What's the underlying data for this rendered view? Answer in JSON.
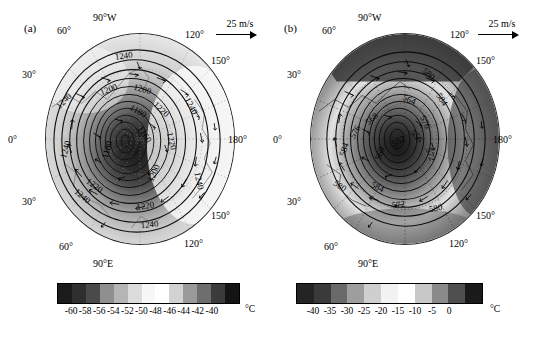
{
  "figure": {
    "type": "two-panel polar stereographic map figure",
    "background": "#ffffff",
    "width": 537,
    "height": 337
  },
  "panels": [
    {
      "id": "a",
      "label": "(a)",
      "projection": "south polar stereographic",
      "wind_scale": {
        "label": "25 m/s",
        "arrow": "right-arrow"
      },
      "lon_labels": {
        "top": "90°W",
        "top_left": "60°",
        "top_right": "120°",
        "left_upper": "30°",
        "left_middle": "0°",
        "left_lower": "30°",
        "right_upper": "150°",
        "right_middle": "180°",
        "right_lower": "150°",
        "bottom": "90°E",
        "bottom_left": "60°",
        "bottom_right": "120°"
      },
      "contour_labels": [
        "1240",
        "1240",
        "1240",
        "1240",
        "1240",
        "1240",
        "1240",
        "1220",
        "1220",
        "1220",
        "1220",
        "1200",
        "1200",
        "1200",
        "1180",
        "1180",
        "1160"
      ],
      "colorbar": {
        "unit": "°C",
        "ticks": [
          "-60",
          "-58",
          "-56",
          "-54",
          "-52",
          "-50",
          "-48",
          "-46",
          "-44",
          "-42",
          "-40"
        ],
        "min": -60,
        "max": -40,
        "step": 2,
        "colors": [
          "#1b1b1b",
          "#2f2f2f",
          "#4a4a4a",
          "#8f8f8f",
          "#b5b5b5",
          "#dcdcdc",
          "#f7f7f7",
          "#ffffff",
          "#d2d2d2",
          "#9a9a9a",
          "#6e6e6e",
          "#3b3b3b",
          "#141414"
        ]
      }
    },
    {
      "id": "b",
      "label": "(b)",
      "projection": "south polar stereographic",
      "wind_scale": {
        "label": "25 m/s",
        "arrow": "right-arrow"
      },
      "lon_labels": {
        "top": "90°W",
        "top_left": "60°",
        "top_right": "120°",
        "left_upper": "30°",
        "left_middle": "0°",
        "left_lower": "30°",
        "right_upper": "150°",
        "right_middle": "180°",
        "right_lower": "150°",
        "bottom": "90°E",
        "bottom_left": "60°",
        "bottom_right": "120°"
      },
      "contour_labels": [
        "580",
        "580",
        "580",
        "584",
        "584",
        "576",
        "576",
        "572",
        "572",
        "568",
        "564",
        "560",
        "556",
        "552",
        "548"
      ],
      "colorbar": {
        "unit": "°C",
        "ticks": [
          "-40",
          "-35",
          "-30",
          "-25",
          "-20",
          "-15",
          "-10",
          "-5",
          "0"
        ],
        "min": -40,
        "max": 0,
        "step": 5,
        "colors": [
          "#242424",
          "#3a3a3a",
          "#6a6a6a",
          "#9e9e9e",
          "#cfcfcf",
          "#f2f2f2",
          "#ffffff",
          "#c8c8c8",
          "#8a8a8a",
          "#4f4f4f",
          "#1a1a1a"
        ]
      }
    }
  ],
  "chart_data": {
    "type": "heatmap",
    "title": "",
    "subtitle": "",
    "xlabel": "",
    "ylabel": "",
    "grid": true,
    "legend_position": "below each panel",
    "panels": [
      {
        "name": "(a)",
        "shaded_field": "temperature",
        "shaded_unit": "°C",
        "shaded_range": [
          -60,
          -40
        ],
        "shaded_interval": 2,
        "contour_field": "geopotential height",
        "contour_values": [
          1160,
          1180,
          1200,
          1220,
          1240
        ],
        "contour_interval": 20,
        "vector_field": "wind",
        "vector_reference": 25,
        "vector_unit": "m/s",
        "latitude_circles": [
          "0°",
          "30°",
          "60°"
        ],
        "longitude_lines": [
          "90°W",
          "60°",
          "30°",
          "0°",
          "120°",
          "150°",
          "180°",
          "90°E"
        ]
      },
      {
        "name": "(b)",
        "shaded_field": "temperature",
        "shaded_unit": "°C",
        "shaded_range": [
          -40,
          0
        ],
        "shaded_interval": 5,
        "contour_field": "geopotential height",
        "contour_values": [
          548,
          552,
          556,
          560,
          564,
          568,
          572,
          576,
          580,
          584
        ],
        "contour_interval": 4,
        "vector_field": "wind",
        "vector_reference": 25,
        "vector_unit": "m/s",
        "latitude_circles": [
          "0°",
          "30°",
          "60°"
        ],
        "longitude_lines": [
          "90°W",
          "60°",
          "30°",
          "0°",
          "120°",
          "150°",
          "180°",
          "90°E"
        ]
      }
    ]
  }
}
